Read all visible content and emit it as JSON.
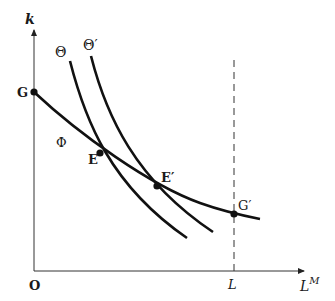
{
  "diagram": {
    "axes": {
      "y_label": "k",
      "x_label_base": "L",
      "x_label_sup": "M",
      "origin_label": "O",
      "x_tick_label": "L"
    },
    "curves": {
      "phi": {
        "label": "Φ"
      },
      "theta": {
        "label": "Θ"
      },
      "theta_prime": {
        "label": "Θ′"
      }
    },
    "points": {
      "G": "G",
      "E": "E",
      "E_prime": "E′",
      "G_prime": "G′"
    },
    "colors": {
      "line": "#111111",
      "background": "#ffffff"
    }
  }
}
